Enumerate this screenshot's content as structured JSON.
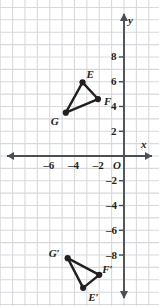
{
  "figure": {
    "type": "coordinate-plane",
    "axis_labels": {
      "x": "x",
      "y": "y",
      "origin": "O"
    },
    "x_ticks": [
      {
        "value": -6,
        "label": "–6"
      },
      {
        "value": -4,
        "label": "–4"
      },
      {
        "value": -2,
        "label": "–2"
      }
    ],
    "y_ticks": [
      {
        "value": 8,
        "label": "8"
      },
      {
        "value": 6,
        "label": "6"
      },
      {
        "value": 4,
        "label": "4"
      },
      {
        "value": 2,
        "label": "2"
      },
      {
        "value": -2,
        "label": "–2"
      },
      {
        "value": -4,
        "label": "–4"
      },
      {
        "value": -6,
        "label": "–6"
      },
      {
        "value": -8,
        "label": "–8"
      }
    ],
    "colors": {
      "grid": "#d7d9dc",
      "axis": "#4b4f54",
      "shape": "#231f20",
      "background": "#ffffff"
    }
  },
  "chart_data": {
    "type": "scatter",
    "title": "",
    "xlabel": "x",
    "ylabel": "y",
    "xlim": [
      -9.5,
      2.8
    ],
    "ylim": [
      -12.1,
      12.6
    ],
    "grid": true,
    "grid_spacing": 1,
    "legend": "none",
    "series": [
      {
        "name": "Triangle EFG",
        "closed": true,
        "points": [
          {
            "label": "E",
            "x": -3.35,
            "y": 5.95,
            "label_dx": 4,
            "label_dy": -13
          },
          {
            "label": "F",
            "x": -2.1,
            "y": 4.6,
            "label_dx": 6,
            "label_dy": -3
          },
          {
            "label": "G",
            "x": -4.7,
            "y": 3.5,
            "label_dx": -13,
            "label_dy": 3
          }
        ]
      },
      {
        "name": "Triangle E'F'G'",
        "closed": true,
        "points": [
          {
            "label": "G′",
            "x": -4.55,
            "y": -8.25,
            "label_dx": -14,
            "label_dy": -10
          },
          {
            "label": "F′",
            "x": -2.0,
            "y": -9.6,
            "label_dx": 3,
            "label_dy": -11
          },
          {
            "label": "E′",
            "x": -3.3,
            "y": -10.65,
            "label_dx": 5,
            "label_dy": 4
          }
        ]
      }
    ]
  }
}
